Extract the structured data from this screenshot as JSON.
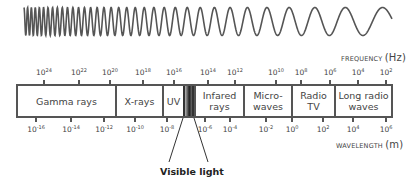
{
  "diagram": {
    "wave": {
      "x_start": 24,
      "x_end": 392,
      "y_center": 21.5,
      "amplitude": 14,
      "stroke": "#555555",
      "description": "sine wave with decreasing frequency left to right"
    },
    "frequency_axis": {
      "title": "FREQUENCY",
      "unit": "(Hz)",
      "ticks": [
        {
          "base": "10",
          "exp": "24",
          "x": 44
        },
        {
          "base": "10",
          "exp": "22",
          "x": 79
        },
        {
          "base": "10",
          "exp": "20",
          "x": 110
        },
        {
          "base": "10",
          "exp": "18",
          "x": 143
        },
        {
          "base": "10",
          "exp": "16",
          "x": 174
        },
        {
          "base": "10",
          "exp": "14",
          "x": 208
        },
        {
          "base": "10",
          "exp": "12",
          "x": 235
        },
        {
          "base": "10",
          "exp": "10",
          "x": 276
        },
        {
          "base": "10",
          "exp": "8",
          "x": 301
        },
        {
          "base": "10",
          "exp": "6",
          "x": 330
        },
        {
          "base": "10",
          "exp": "4",
          "x": 358
        },
        {
          "base": "10",
          "exp": "2",
          "x": 386
        }
      ]
    },
    "wavelength_axis": {
      "title": "WAVELENGTH",
      "unit": "(m)",
      "ticks": [
        {
          "base": "10",
          "exp": "-16",
          "x": 36
        },
        {
          "base": "10",
          "exp": "-14",
          "x": 71
        },
        {
          "base": "10",
          "exp": "-12",
          "x": 104
        },
        {
          "base": "10",
          "exp": "-10",
          "x": 135
        },
        {
          "base": "10",
          "exp": "-8",
          "x": 167
        },
        {
          "base": "10",
          "exp": "-6",
          "x": 205
        },
        {
          "base": "10",
          "exp": "-4",
          "x": 230
        },
        {
          "base": "10",
          "exp": "-2",
          "x": 266
        },
        {
          "base": "10",
          "exp": "0",
          "x": 292
        },
        {
          "base": "10",
          "exp": "2",
          "x": 323
        },
        {
          "base": "10",
          "exp": "4",
          "x": 353
        },
        {
          "base": "10",
          "exp": "6",
          "x": 386
        }
      ]
    },
    "bands": [
      {
        "label": "Gamma rays",
        "start": 16,
        "end": 115
      },
      {
        "label": "X-rays",
        "start": 115,
        "end": 162
      },
      {
        "label": "UV",
        "start": 162,
        "end": 183
      },
      {
        "label": "",
        "start": 183,
        "end": 194,
        "visible": true
      },
      {
        "label": "Infared\nrays",
        "start": 194,
        "end": 243
      },
      {
        "label": "Micro-\nwaves",
        "start": 243,
        "end": 291
      },
      {
        "label": "Radio\nTV",
        "start": 291,
        "end": 334
      },
      {
        "label": "Long radio\nwaves",
        "start": 334,
        "end": 393
      }
    ],
    "visible_light_label": "Visible light"
  }
}
